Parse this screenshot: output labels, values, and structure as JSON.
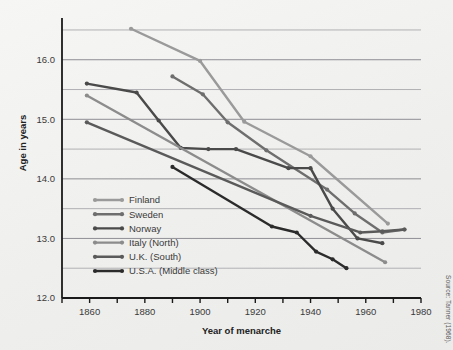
{
  "figure": {
    "background_color": "#f1f1ef",
    "source_note": "Source: Tanner (1968)."
  },
  "chart_data": {
    "type": "line",
    "title": "",
    "xlabel": "Year of menarche",
    "ylabel": "Age in years",
    "xlim": [
      1850,
      1980
    ],
    "ylim": [
      12.0,
      16.6
    ],
    "grid": true,
    "grid_axis": "y",
    "legend_position": "inside-lower-left",
    "x_major_ticks": [
      1860,
      1880,
      1900,
      1920,
      1940,
      1960,
      1980
    ],
    "x_major_tick_labels": [
      "1860",
      "1880",
      "1900",
      "1920",
      "1940",
      "1960",
      "1980"
    ],
    "x_minor_ticks": [
      1850,
      1870,
      1890,
      1910,
      1930,
      1950,
      1970
    ],
    "y_major_ticks": [
      12.0,
      13.0,
      14.0,
      15.0,
      16.0
    ],
    "y_major_tick_labels": [
      "12.0",
      "13.0",
      "14.0",
      "15.0",
      "16.0"
    ],
    "y_minor_gridlines": [
      12.5,
      13.5,
      14.5,
      15.5,
      16.5
    ],
    "series": [
      {
        "name": "Finland",
        "color": "#9a9a9a",
        "points": [
          {
            "x": 1875,
            "y": 16.52
          },
          {
            "x": 1900,
            "y": 15.98
          },
          {
            "x": 1916,
            "y": 14.96
          },
          {
            "x": 1940,
            "y": 14.38
          },
          {
            "x": 1968,
            "y": 13.25
          }
        ]
      },
      {
        "name": "Sweden",
        "color": "#6e6e6e",
        "points": [
          {
            "x": 1890,
            "y": 15.72
          },
          {
            "x": 1901,
            "y": 15.42
          },
          {
            "x": 1910,
            "y": 14.95
          },
          {
            "x": 1924,
            "y": 14.48
          },
          {
            "x": 1946,
            "y": 13.82
          },
          {
            "x": 1956,
            "y": 13.42
          },
          {
            "x": 1966,
            "y": 13.1
          },
          {
            "x": 1974,
            "y": 13.15
          }
        ]
      },
      {
        "name": "Norway",
        "color": "#4a4a4a",
        "points": [
          {
            "x": 1859,
            "y": 15.6
          },
          {
            "x": 1877,
            "y": 15.45
          },
          {
            "x": 1885,
            "y": 14.98
          },
          {
            "x": 1893,
            "y": 14.52
          },
          {
            "x": 1903,
            "y": 14.5
          },
          {
            "x": 1913,
            "y": 14.5
          },
          {
            "x": 1932,
            "y": 14.18
          },
          {
            "x": 1940,
            "y": 14.18
          },
          {
            "x": 1948,
            "y": 13.5
          },
          {
            "x": 1957,
            "y": 13.0
          },
          {
            "x": 1966,
            "y": 12.92
          }
        ]
      },
      {
        "name": "Italy (North)",
        "color": "#8c8c8c",
        "points": [
          {
            "x": 1859,
            "y": 15.4
          },
          {
            "x": 1967,
            "y": 12.6
          }
        ]
      },
      {
        "name": "U.K. (South)",
        "color": "#5a5a5a",
        "points": [
          {
            "x": 1859,
            "y": 14.95
          },
          {
            "x": 1940,
            "y": 13.38
          },
          {
            "x": 1958,
            "y": 13.1
          },
          {
            "x": 1966,
            "y": 13.12
          },
          {
            "x": 1974,
            "y": 13.15
          }
        ]
      },
      {
        "name": "U.S.A. (Middle class)",
        "color": "#2b2b2b",
        "points": [
          {
            "x": 1890,
            "y": 14.2
          },
          {
            "x": 1926,
            "y": 13.2
          },
          {
            "x": 1935,
            "y": 13.1
          },
          {
            "x": 1942,
            "y": 12.78
          },
          {
            "x": 1948,
            "y": 12.65
          },
          {
            "x": 1953,
            "y": 12.5
          }
        ]
      }
    ]
  },
  "legend": {
    "entries": [
      {
        "label": "Finland",
        "color": "#9a9a9a"
      },
      {
        "label": "Sweden",
        "color": "#6e6e6e"
      },
      {
        "label": "Norway",
        "color": "#4a4a4a"
      },
      {
        "label": "Italy (North)",
        "color": "#8c8c8c"
      },
      {
        "label": "U.K. (South)",
        "color": "#5a5a5a"
      },
      {
        "label": "U.S.A. (Middle class)",
        "color": "#2b2b2b"
      }
    ]
  }
}
